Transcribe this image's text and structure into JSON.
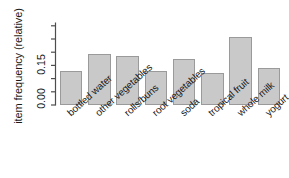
{
  "chart_data": {
    "type": "bar",
    "title": "",
    "subtitle": "",
    "xlabel": "",
    "ylabel": "item frequency (relative)",
    "categories": [
      "bottled water",
      "other vegetables",
      "rolls/buns",
      "root vegetables",
      "soda",
      "tropical fruit",
      "whole milk",
      "yogurt"
    ],
    "values": [
      0.129,
      0.193,
      0.185,
      0.129,
      0.174,
      0.121,
      0.256,
      0.14
    ],
    "ylim": [
      0.0,
      0.275
    ],
    "ytick_labels": [
      "0.00",
      "0.15"
    ],
    "ytick_values": [
      0.0,
      0.15
    ],
    "minor_ticks": [
      0.05,
      0.1,
      0.2,
      0.25
    ],
    "grid": false,
    "legend": null,
    "bar_fill_color": "#c9c9c9",
    "bar_border_color": "#9a9a9a",
    "axis_color": "#4d4d4d",
    "text_color": "#1a1a1a",
    "background_color": "#ffffff"
  }
}
